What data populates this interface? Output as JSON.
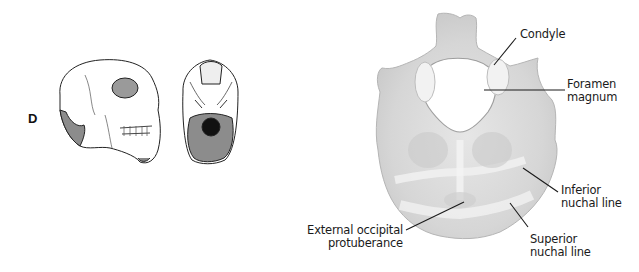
{
  "figure": {
    "panel_letter": "D",
    "thumbnails": [
      {
        "name": "skull-lateral-view",
        "description": "Lateral view of skull with occipital region shaded"
      },
      {
        "name": "skull-inferior-view",
        "description": "Inferior view of skull base with occipital bone shaded"
      }
    ],
    "main_view": "Occipital bone, inferior view",
    "labels": [
      {
        "id": "condyle",
        "lines": [
          "Condyle"
        ]
      },
      {
        "id": "foramen-magnum",
        "lines": [
          "Foramen",
          "magnum"
        ]
      },
      {
        "id": "inferior-nuchal-line",
        "lines": [
          "Inferior",
          "nuchal line"
        ]
      },
      {
        "id": "external-occipital-protuberance",
        "lines": [
          "External occipital",
          "protuberance"
        ]
      },
      {
        "id": "superior-nuchal-line",
        "lines": [
          "Superior",
          "nuchal line"
        ]
      }
    ],
    "colors": {
      "bone_fill": "#d9d9d9",
      "bone_light": "#ebebeb",
      "bone_shadow": "#bdbdbd",
      "shaded_region": "#8c8c8c",
      "line": "#1a1a1a",
      "background": "#ffffff"
    }
  }
}
